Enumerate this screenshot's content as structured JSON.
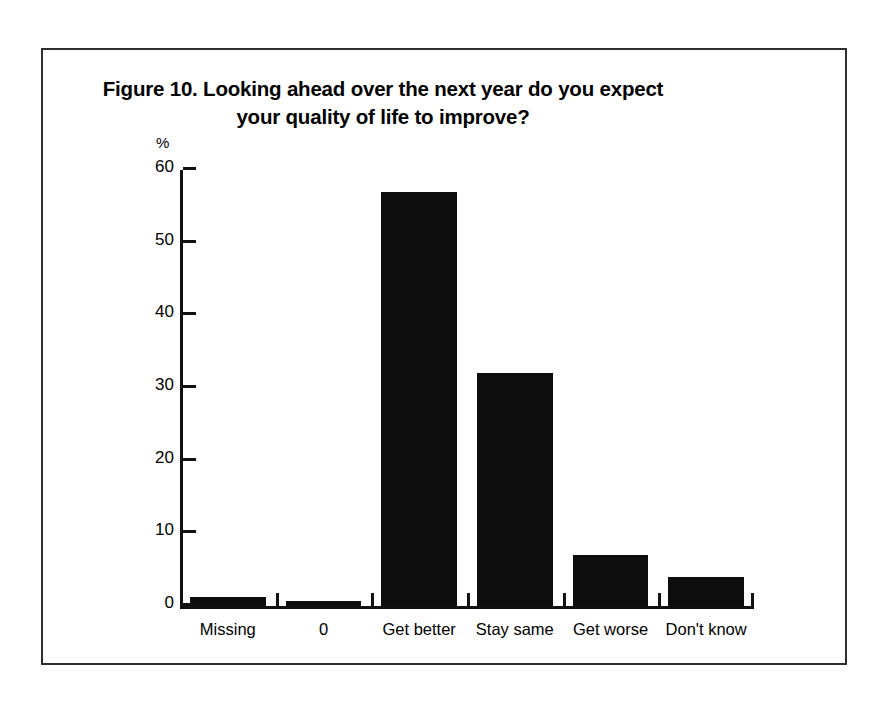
{
  "figure": {
    "title_lines": [
      "Figure 10. Looking ahead over the next year do you expect",
      "your quality of life to improve?"
    ]
  },
  "chart_data": {
    "type": "bar",
    "title": "Figure 10. Looking ahead over the next year do you expect your quality of life to improve?",
    "xlabel": "",
    "ylabel": "%",
    "categories": [
      "Missing",
      "0",
      "Get better",
      "Stay same",
      "Get worse",
      "Don't know"
    ],
    "values": [
      1.2,
      0.7,
      57.0,
      32.0,
      7.0,
      4.0
    ],
    "ylim": [
      0,
      60
    ],
    "yticks": [
      0,
      10,
      20,
      30,
      40,
      50,
      60
    ],
    "ytick_labels": [
      "0",
      "10",
      "20",
      "30",
      "40",
      "50",
      "60"
    ],
    "grid": false,
    "legend": null,
    "bar_color": "#0d0d0d"
  }
}
